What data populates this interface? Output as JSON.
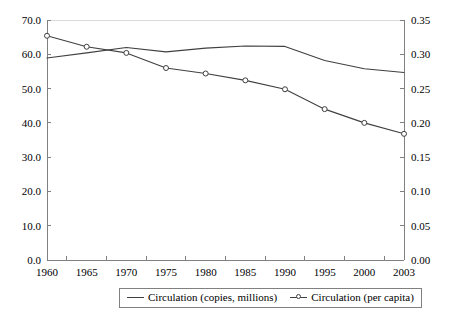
{
  "chart_data": {
    "type": "line",
    "title": "",
    "subtitle": "",
    "xlabel": "",
    "ylabel": "",
    "grid": false,
    "legend_position": "bottom",
    "categories": [
      "1960",
      "1965",
      "1970",
      "1975",
      "1980",
      "1985",
      "1990",
      "1995",
      "2000",
      "2003"
    ],
    "axes": {
      "left": {
        "label": "Circulation (copies, millions)",
        "ylim": [
          0.0,
          70.0
        ],
        "tick_step": 10.0,
        "tick_labels": [
          "0.0",
          "10.0",
          "20.0",
          "30.0",
          "40.0",
          "50.0",
          "60.0",
          "70.0"
        ],
        "tick_values": [
          0.0,
          10.0,
          20.0,
          30.0,
          40.0,
          50.0,
          60.0,
          70.0
        ]
      },
      "right": {
        "label": "Circulation (per capita)",
        "ylim": [
          0.0,
          0.35
        ],
        "tick_step": 0.05,
        "tick_labels": [
          "0.00",
          "0.05",
          "0.10",
          "0.15",
          "0.20",
          "0.25",
          "0.30",
          "0.35"
        ],
        "tick_values": [
          0.0,
          0.05,
          0.1,
          0.15,
          0.2,
          0.25,
          0.3,
          0.35
        ]
      }
    },
    "series": [
      {
        "name": "Circulation (copies, millions)",
        "axis": "left",
        "markers": false,
        "color": "#404040",
        "values": [
          58.9,
          60.4,
          62.0,
          60.7,
          61.8,
          62.4,
          62.3,
          58.2,
          55.8,
          54.7
        ]
      },
      {
        "name": "Circulation (per capita)",
        "axis": "right",
        "markers": true,
        "color": "#404040",
        "values": [
          0.327,
          0.311,
          0.302,
          0.28,
          0.272,
          0.262,
          0.249,
          0.22,
          0.2,
          0.184
        ]
      }
    ]
  },
  "legend": {
    "items": [
      {
        "label": "Circulation (copies, millions)"
      },
      {
        "label": "Circulation (per capita)"
      }
    ]
  },
  "colors": {
    "line": "#404040",
    "axis": "#808080",
    "background": "#ffffff"
  }
}
